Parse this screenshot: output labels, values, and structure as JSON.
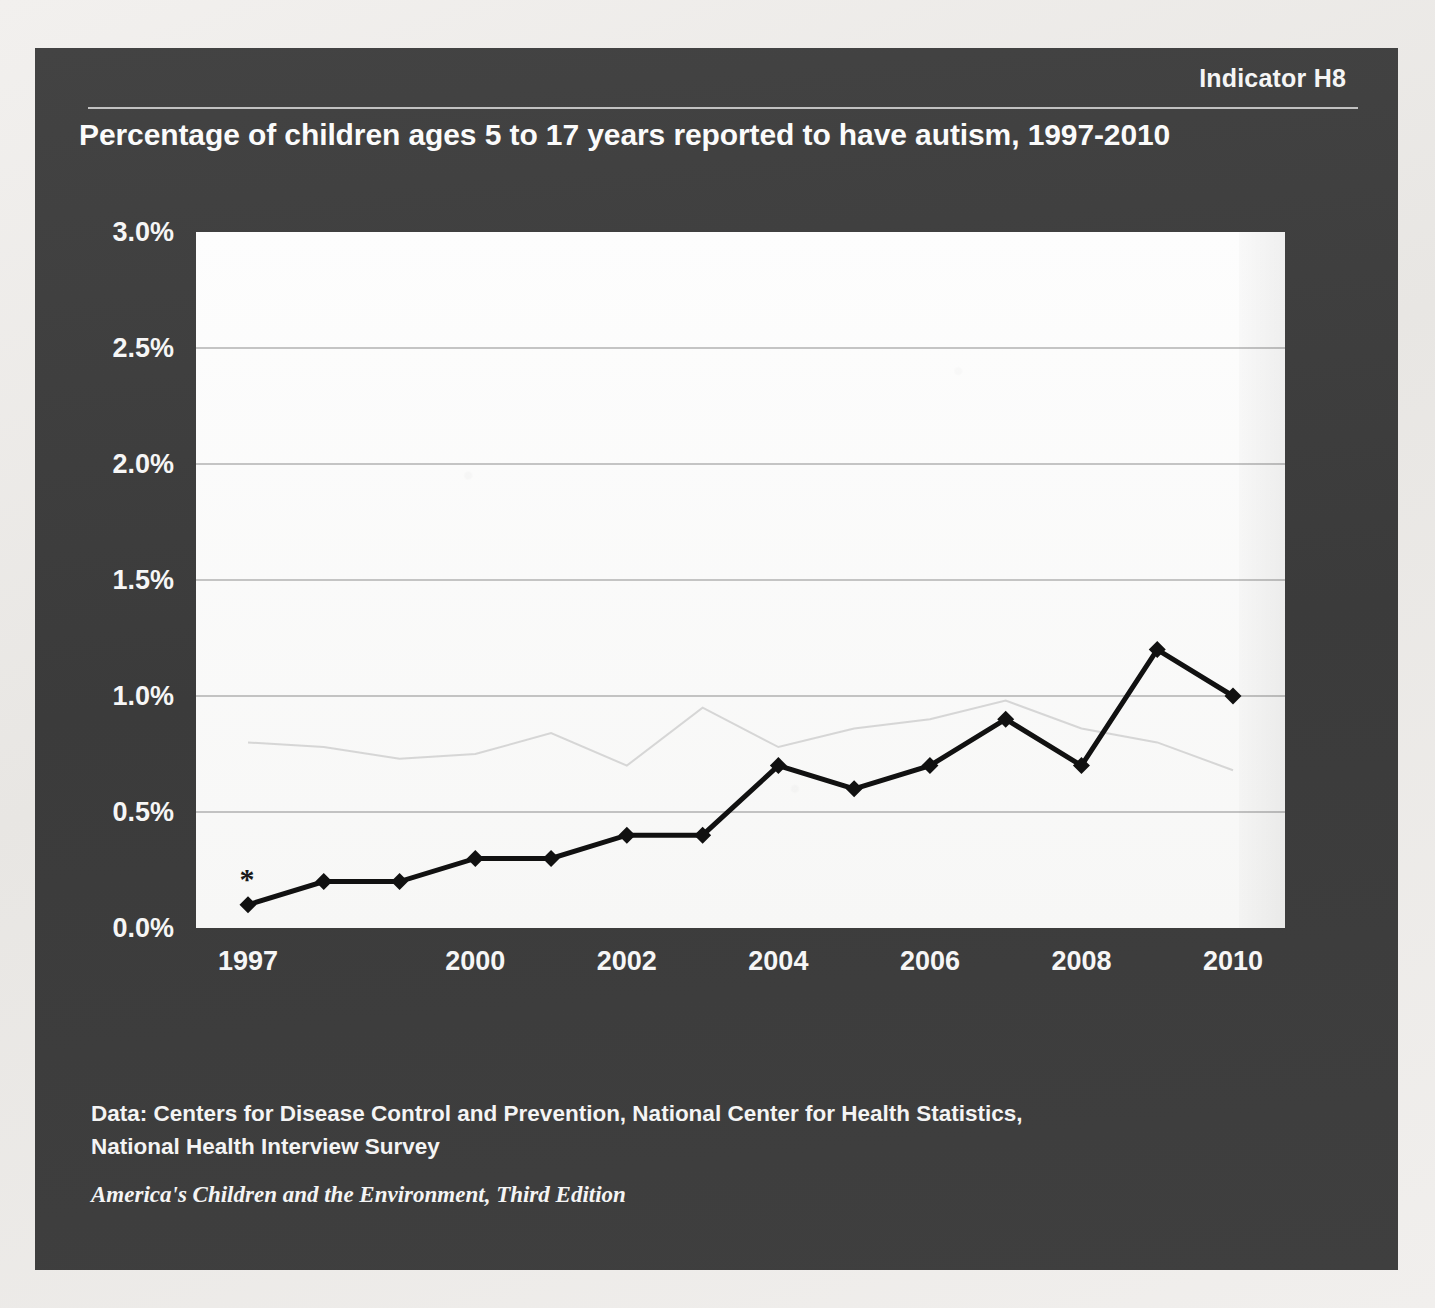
{
  "panel": {
    "indicator_label": "Indicator H8",
    "title": "Percentage of children ages 5 to 17 years reported to have autism, 1997-2010",
    "background_color": "#3e3e3e",
    "text_color": "#f4f4f4"
  },
  "footer": {
    "data_source_line1": "Data: Centers for Disease Control and Prevention, National Center for Health Statistics,",
    "data_source_line2": "National Health Interview Survey",
    "edition": "America's Children and the Environment, Third Edition"
  },
  "annotations": {
    "asterisk": "*"
  },
  "chart_data": {
    "type": "line",
    "title": "Percentage of children ages 5 to 17 years reported to have autism, 1997-2010",
    "xlabel": "",
    "ylabel": "",
    "x": [
      1997,
      1998,
      1999,
      2000,
      2001,
      2002,
      2003,
      2004,
      2005,
      2006,
      2007,
      2008,
      2009,
      2010
    ],
    "values": [
      0.1,
      0.2,
      0.2,
      0.3,
      0.3,
      0.4,
      0.4,
      0.7,
      0.6,
      0.7,
      0.9,
      0.7,
      1.2,
      1.0
    ],
    "series": [
      {
        "name": "Percentage of children ages 5 to 17 years reported to have autism",
        "values": [
          0.1,
          0.2,
          0.2,
          0.3,
          0.3,
          0.4,
          0.4,
          0.7,
          0.6,
          0.7,
          0.9,
          0.7,
          1.2,
          1.0
        ],
        "color": "#111111",
        "marker": "diamond"
      }
    ],
    "ylim": [
      0.0,
      3.0
    ],
    "yticks": [
      0.0,
      0.5,
      1.0,
      1.5,
      2.0,
      2.5,
      3.0
    ],
    "ytick_labels": [
      "0.0%",
      "0.5%",
      "1.0%",
      "1.5%",
      "2.0%",
      "2.5%",
      "3.0%"
    ],
    "xticks": [
      1997,
      2000,
      2002,
      2004,
      2006,
      2008,
      2010
    ],
    "xtick_labels": [
      "1997",
      "2000",
      "2002",
      "2004",
      "2006",
      "2008",
      "2010"
    ],
    "grid": "horizontal",
    "legend": "none",
    "annotation_marks": [
      {
        "x": 1997,
        "y": 0.1,
        "text": "*"
      }
    ]
  }
}
